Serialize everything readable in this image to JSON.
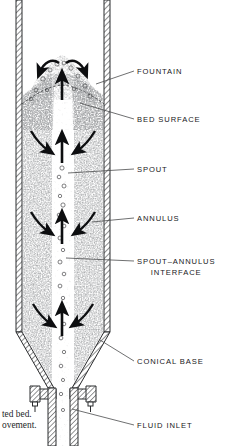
{
  "figure": {
    "vessel_name": "spouted-bed-column"
  },
  "labels": [
    {
      "id": "fountain",
      "text": "FOUNTAIN",
      "text2": "",
      "x": 137,
      "y": 74
    },
    {
      "id": "bed-surface",
      "text": "BED  SURFACE",
      "text2": "",
      "x": 137,
      "y": 122
    },
    {
      "id": "spout",
      "text": "SPOUT",
      "text2": "",
      "x": 137,
      "y": 172
    },
    {
      "id": "annulus",
      "text": "ANNULUS",
      "text2": "",
      "x": 137,
      "y": 221
    },
    {
      "id": "spout-annulus-interface",
      "text": "SPOUT–ANNULUS",
      "text2": "INTERFACE",
      "x": 137,
      "y": 264
    },
    {
      "id": "conical-base",
      "text": "CONICAL  BASE",
      "text2": "",
      "x": 137,
      "y": 364
    },
    {
      "id": "fluid-inlet",
      "text": "FLUID  INLET",
      "text2": "",
      "x": 137,
      "y": 428
    }
  ],
  "caption": {
    "line1": "ted bed.",
    "line2": "ovement."
  },
  "colors": {
    "ink": "#17181a",
    "wall": "#2b2c2e",
    "particles": "#555658",
    "background": "#ffffff",
    "leader": "#4a4b4d"
  },
  "regions": {
    "fountain_zone": "fountain-region",
    "annulus_zone": "annulus-packed-region",
    "spout_zone": "spout-core-channel",
    "cone_zone": "conical-base-region",
    "inlet_zone": "fluid-inlet-pipe",
    "flange_zone": "flange-bolt-assembly"
  },
  "arrows": {
    "up_arrow_name": "spout-upflow-arrow",
    "curved_arrow_name": "annulus-downflow-arrow",
    "fountain_arrow_name": "fountain-spray-arrow"
  }
}
